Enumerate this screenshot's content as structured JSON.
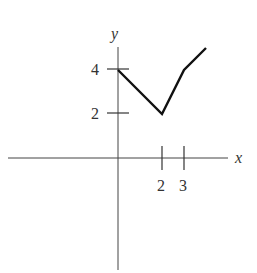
{
  "chart_data": {
    "type": "line",
    "title": "",
    "xlabel": "x",
    "ylabel": "y",
    "x_ticks": [
      2,
      3
    ],
    "x_tick_labels": [
      "2",
      "3"
    ],
    "y_ticks": [
      2,
      4
    ],
    "y_tick_labels": [
      "2",
      "4"
    ],
    "grid": false,
    "legend": null,
    "series": [
      {
        "name": "piecewise linear",
        "points": [
          [
            0,
            4
          ],
          [
            2,
            2
          ],
          [
            3,
            4
          ],
          [
            4,
            5
          ]
        ]
      }
    ],
    "xlim": [
      -5,
      5
    ],
    "ylim": [
      -5,
      5
    ]
  },
  "labels": {
    "x_axis": "x",
    "y_axis": "y",
    "tick_x_2": "2",
    "tick_x_3": "3",
    "tick_y_2": "2",
    "tick_y_4": "4"
  }
}
